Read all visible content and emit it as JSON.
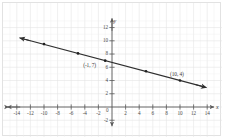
{
  "chart_data": {
    "type": "scatter",
    "title": "",
    "subtitle": "",
    "xlabel": "x",
    "ylabel": "y",
    "xlim": [
      -15,
      15
    ],
    "ylim": [
      -3,
      13
    ],
    "xticks": [
      -14,
      -12,
      -10,
      -8,
      -6,
      -4,
      -2,
      0,
      2,
      4,
      6,
      8,
      10,
      12,
      14
    ],
    "yticks": [
      -2,
      0,
      2,
      4,
      6,
      8,
      10,
      12
    ],
    "xtick_labels": [
      "-14",
      "-12",
      "-10",
      "-8",
      "-6",
      "-4",
      "-2",
      "0",
      "2",
      "4",
      "6",
      "8",
      "10",
      "12",
      "14"
    ],
    "ytick_labels": [
      "-2",
      "0",
      "2",
      "4",
      "6",
      "8",
      "10",
      "12"
    ],
    "grid": true,
    "legend": "none",
    "origin_label": "0",
    "axis_arrows": "both-ends",
    "series": [
      {
        "name": "plotted-points",
        "type": "scatter",
        "points": [
          {
            "x": -10,
            "y": 9.5
          },
          {
            "x": -5,
            "y": 8.1
          },
          {
            "x": -1,
            "y": 7
          },
          {
            "x": 5,
            "y": 5.4
          },
          {
            "x": 10,
            "y": 4
          }
        ]
      },
      {
        "name": "best-fit-line",
        "type": "line",
        "slope": -0.2727,
        "intercept": 6.727,
        "through": [
          {
            "x": -1,
            "y": 7
          },
          {
            "x": 10,
            "y": 4
          }
        ],
        "x_start": -13.6,
        "x_end": 13.9,
        "arrow_ends": "both"
      }
    ],
    "annotations": [
      {
        "name": "point-label-left",
        "text": "(-1, 7)",
        "x": -1,
        "y": 7,
        "position": "left-below"
      },
      {
        "name": "point-label-right",
        "text": "(10, 4)",
        "x": 10,
        "y": 4,
        "position": "above"
      }
    ]
  },
  "axis": {
    "x_name": "x",
    "y_name": "y"
  },
  "colors": {
    "background": "#ffffff",
    "grid_minor": "#f0f0f0",
    "grid_major": "#e4e4e4",
    "axis": "#5a5a5a",
    "line": "#2f2f2f",
    "point": "#1f1f1f",
    "text": "#3c3c3c",
    "border": "#e2e2e2"
  }
}
